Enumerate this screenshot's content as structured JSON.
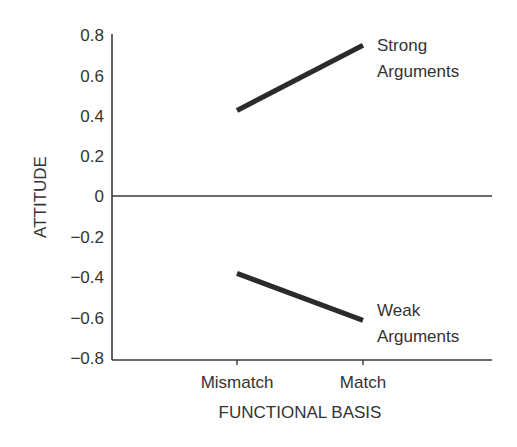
{
  "chart_data": {
    "type": "line",
    "title": "",
    "xlabel": "FUNCTIONAL BASIS",
    "ylabel": "ATTITUDE",
    "categories": [
      "Mismatch",
      "Match"
    ],
    "series": [
      {
        "name": "Strong Arguments",
        "label_lines": [
          "Strong",
          "Arguments"
        ],
        "values": [
          0.42,
          0.74
        ]
      },
      {
        "name": "Weak Arguments",
        "label_lines": [
          "Weak",
          "Arguments"
        ],
        "values": [
          -0.38,
          -0.61
        ]
      }
    ],
    "ylim": [
      -0.8,
      0.8
    ],
    "yticks": [
      "0.8",
      "0.6",
      "0.4",
      "0.2",
      "0",
      "−0.2",
      "−0.4",
      "−0.6",
      "−0.8"
    ],
    "grid": false,
    "legend": "direct labels at line ends",
    "zero_line": true,
    "line_color": "#2b2b2b"
  }
}
